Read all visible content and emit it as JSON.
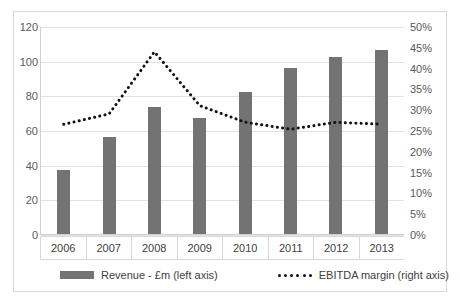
{
  "chart_data": {
    "type": "bar",
    "title": "",
    "subtitle": "",
    "xlabel": "",
    "ylabel": "",
    "categories": [
      "2006",
      "2007",
      "2008",
      "2009",
      "2010",
      "2011",
      "2012",
      "2013"
    ],
    "series": [
      {
        "name": "Revenue - £m (left axis)",
        "type": "bar",
        "axis": "left",
        "color": "#737373",
        "values": [
          37,
          56,
          73,
          67,
          82,
          96,
          102,
          106
        ]
      },
      {
        "name": "EBITDA margin (right axis)",
        "type": "line",
        "style": "dotted",
        "axis": "right",
        "color": "#111111",
        "values": [
          26.5,
          29.0,
          44.0,
          31.0,
          27.0,
          25.3,
          27.0,
          26.5
        ]
      }
    ],
    "left_axis": {
      "ticks": [
        "0",
        "20",
        "40",
        "60",
        "80",
        "100",
        "120"
      ],
      "tick_values": [
        0,
        20,
        40,
        60,
        80,
        100,
        120
      ],
      "ylim": [
        0,
        120
      ]
    },
    "right_axis": {
      "ticks": [
        "0%",
        "5%",
        "10%",
        "15%",
        "20%",
        "25%",
        "30%",
        "35%",
        "40%",
        "45%",
        "50%"
      ],
      "tick_values": [
        0,
        5,
        10,
        15,
        20,
        25,
        30,
        35,
        40,
        45,
        50
      ],
      "ylim": [
        0,
        50
      ]
    },
    "grid": true,
    "gridline_values": [
      0,
      20,
      40,
      60,
      80,
      100,
      120
    ],
    "legend_position": "bottom"
  },
  "legend": {
    "items": [
      {
        "label": "Revenue - £m (left axis)",
        "marker": "bar-swatch-icon"
      },
      {
        "label": "EBITDA margin (right axis)",
        "marker": "dotted-line-icon"
      }
    ]
  },
  "colors": {
    "bar": "#737373",
    "line": "#111111",
    "grid": "#e3e3e3",
    "axis_text": "#595959",
    "border": "#d9d9d9",
    "background": "#ffffff"
  }
}
